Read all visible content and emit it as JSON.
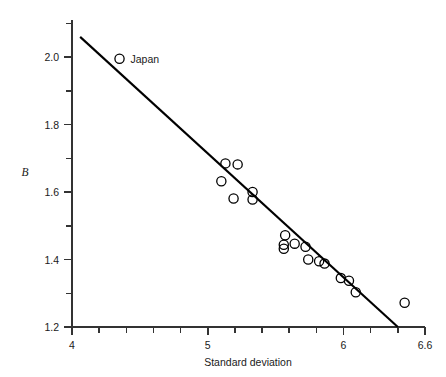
{
  "chart_data": {
    "type": "scatter",
    "title": "",
    "xlabel": "Standard deviation",
    "ylabel": "B",
    "xlim": [
      4,
      6.6
    ],
    "ylim": [
      1.2,
      2.11
    ],
    "grid": false,
    "legend": "none",
    "x_ticks": [
      {
        "value": 4,
        "label": "4",
        "major": true
      },
      {
        "value": 4.2,
        "label": "",
        "major": false
      },
      {
        "value": 4.4,
        "label": "",
        "major": false
      },
      {
        "value": 4.6,
        "label": "",
        "major": false
      },
      {
        "value": 4.8,
        "label": "",
        "major": false
      },
      {
        "value": 5,
        "label": "5",
        "major": true
      },
      {
        "value": 5.2,
        "label": "",
        "major": false
      },
      {
        "value": 5.4,
        "label": "",
        "major": false
      },
      {
        "value": 5.6,
        "label": "",
        "major": false
      },
      {
        "value": 5.8,
        "label": "",
        "major": false
      },
      {
        "value": 6,
        "label": "6",
        "major": true
      },
      {
        "value": 6.2,
        "label": "",
        "major": false
      },
      {
        "value": 6.4,
        "label": "",
        "major": false
      },
      {
        "value": 6.6,
        "label": "6.6",
        "major": true
      }
    ],
    "y_ticks": [
      {
        "value": 1.2,
        "label": "1.2",
        "major": true
      },
      {
        "value": 1.3,
        "label": "",
        "major": false
      },
      {
        "value": 1.4,
        "label": "1.4",
        "major": true
      },
      {
        "value": 1.5,
        "label": "",
        "major": false
      },
      {
        "value": 1.6,
        "label": "1.6",
        "major": true
      },
      {
        "value": 1.7,
        "label": "",
        "major": false
      },
      {
        "value": 1.8,
        "label": "1.8",
        "major": true
      },
      {
        "value": 1.9,
        "label": "",
        "major": false
      },
      {
        "value": 2.0,
        "label": "2.0",
        "major": true
      },
      {
        "value": 2.1,
        "label": "",
        "major": false
      }
    ],
    "points": [
      {
        "x": 5.13,
        "y": 1.685
      },
      {
        "x": 5.22,
        "y": 1.682
      },
      {
        "x": 5.1,
        "y": 1.632
      },
      {
        "x": 5.19,
        "y": 1.581
      },
      {
        "x": 5.33,
        "y": 1.6
      },
      {
        "x": 5.33,
        "y": 1.578
      },
      {
        "x": 5.57,
        "y": 1.472
      },
      {
        "x": 5.56,
        "y": 1.444
      },
      {
        "x": 5.56,
        "y": 1.432
      },
      {
        "x": 5.64,
        "y": 1.447
      },
      {
        "x": 5.72,
        "y": 1.438
      },
      {
        "x": 5.74,
        "y": 1.4
      },
      {
        "x": 5.82,
        "y": 1.395
      },
      {
        "x": 5.86,
        "y": 1.388
      },
      {
        "x": 5.98,
        "y": 1.345
      },
      {
        "x": 6.04,
        "y": 1.337
      },
      {
        "x": 6.09,
        "y": 1.303
      },
      {
        "x": 6.45,
        "y": 1.272
      }
    ],
    "annotations": [
      {
        "label": "Japan",
        "marker_x": 4.35,
        "marker_y": 1.995
      }
    ],
    "fit_line": {
      "x1": 4.06,
      "y1": 2.06,
      "x2": 6.4,
      "y2": 1.2
    },
    "marker": {
      "shape": "open-circle",
      "radius_px": 4.6,
      "color": "#000000"
    },
    "line_color": "#000000",
    "axis_color": "#333333"
  }
}
